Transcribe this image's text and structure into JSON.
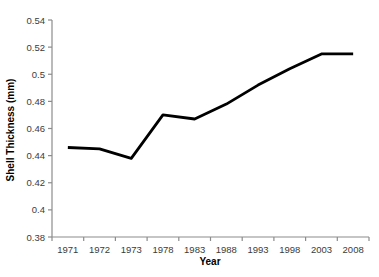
{
  "figure": {
    "background_color": "#ffffff"
  },
  "chart_data": {
    "type": "line",
    "title": "",
    "xlabel": "Year",
    "ylabel": "Shell Thickness (mm)",
    "categories": [
      "1971",
      "1972",
      "1973",
      "1978",
      "1983",
      "1988",
      "1993",
      "1998",
      "2003",
      "2008"
    ],
    "series": [
      {
        "name": "shell-thickness",
        "values": [
          0.446,
          0.445,
          0.438,
          0.47,
          0.467,
          0.478,
          0.492,
          0.504,
          0.515,
          0.515
        ],
        "color": "#000000",
        "stroke_width": 2.8
      }
    ],
    "ylim": [
      0.38,
      0.54
    ],
    "ytick_step": 0.02,
    "yticks": [
      "0.54",
      "0.52",
      "0.5",
      "0.48",
      "0.46",
      "0.44",
      "0.42",
      "0.4",
      "0.38"
    ],
    "grid": false,
    "legend_position": "none",
    "axis_color": "#8c8c8c",
    "tick_label_color": "#3b3b3b",
    "axis_title_color": "#000000"
  }
}
